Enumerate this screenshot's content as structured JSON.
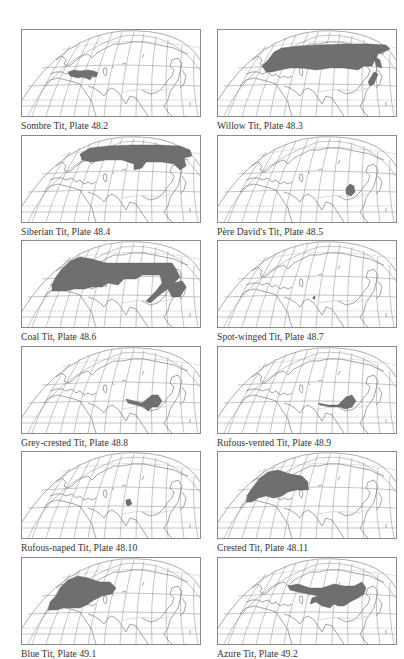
{
  "page": {
    "layout": "2-column grid of range maps, 6 rows",
    "colors": {
      "range_fill": "#6f6f6f",
      "graticule": "#8a8a8a",
      "coastline": "#6a6a6a",
      "frame": "#8a8a8a",
      "caption": "#333333"
    }
  },
  "maps": [
    {
      "caption": "Sombre Tit, Plate 48.2",
      "species": "Sombre Tit",
      "plate": "48.2",
      "range": [
        "M46,42 L52,40 L58,41 L66,40 L72,41 L76,43 L74,47 L70,46 L68,50 L64,48 L60,47 L56,48 L52,47 L48,46 Z"
      ]
    },
    {
      "caption": "Willow Tit, Plate 48.3",
      "species": "Willow Tit",
      "plate": "48.3",
      "range": [
        "M44,36 L50,30 L56,22 L64,18 L80,16 L100,15 L126,14 L150,14 L168,15 L172,19 L166,22 L160,24 L154,36 L146,36 L140,40 L126,38 L112,38 L98,40 L84,38 L72,38 L62,40 L54,42 L48,42 Z",
        "M156,26 L162,30 L164,38 L158,36 Z",
        "M156,42 L160,44 L156,54 L152,56 L150,52 Z"
      ]
    },
    {
      "caption": "Siberian Tit, Plate 48.4",
      "species": "Siberian Tit",
      "plate": "48.4",
      "range": [
        "M58,18 L68,12 L86,10 L110,9 L136,9 L158,10 L168,14 L170,20 L162,22 L164,30 L158,34 L152,28 L140,26 L124,26 L120,32 L112,34 L112,28 L100,24 L84,24 L70,26 L60,24 Z"
      ]
    },
    {
      "caption": "Père David's Tit, Plate 48.5",
      "species": "Père David's Tit",
      "plate": "48.5",
      "range": [
        "M128,52 L132,48 L136,50 L137,56 L133,60 L128,58 Z"
      ]
    },
    {
      "caption": "Coal Tit, Plate 48.6",
      "species": "Coal Tit",
      "plate": "48.6",
      "range": [
        "M30,44 L34,36 L40,28 L48,20 L58,16 L70,18 L84,22 L110,22 L138,22 L150,22 L154,28 L158,36 L152,42 L160,40 L164,46 L158,56 L150,56 L146,48 L140,52 L128,62 L124,60 L134,50 L140,42 L138,34 L120,34 L114,38 L102,38 L96,44 L86,42 L80,46 L70,46 L62,48 L52,48 L44,50 L36,50 L30,50 Z"
      ]
    },
    {
      "caption": "Spot-winged Tit, Plate 48.7",
      "species": "Spot-winged Tit",
      "plate": "48.7",
      "range": [
        "M95,56 L97,55 L97,58 L95,58 Z"
      ]
    },
    {
      "caption": "Grey-crested Tit, Plate 48.8",
      "species": "Grey-crested Tit",
      "plate": "48.8",
      "range": [
        "M104,52 L112,54 L120,56 L130,48 L136,48 L140,54 L136,60 L130,60 L126,64 L122,60 L114,58 L106,56 Z"
      ]
    },
    {
      "caption": "Rufous-vented Tit, Plate 48.9",
      "species": "Rufous-vented Tit",
      "plate": "48.9",
      "range": [
        "M100,56 L110,58 L120,58 L128,50 L134,48 L138,54 L134,60 L128,62 L122,60 L112,60 L102,58 Z"
      ]
    },
    {
      "caption": "Rufous-naped Tit, Plate 48.10",
      "species": "Rufous-naped Tit",
      "plate": "48.10",
      "range": [
        "M104,48 L108,47 L110,52 L106,54 L104,52 Z"
      ]
    },
    {
      "caption": "Crested Tit, Plate 48.11",
      "species": "Crested Tit",
      "plate": "48.11",
      "range": [
        "M28,50 L30,42 L36,34 L42,26 L50,20 L60,18 L72,22 L84,24 L90,30 L90,38 L78,38 L70,40 L64,44 L56,46 L48,44 L40,46 L34,50 Z"
      ]
    },
    {
      "caption": "Blue Tit, Plate 49.1",
      "species": "Blue Tit",
      "plate": "49.1",
      "range": [
        "M26,52 L28,44 L34,38 L38,30 L46,22 L56,18 L66,20 L78,24 L88,24 L94,30 L90,36 L80,38 L72,42 L66,46 L58,50 L50,50 L42,50 L34,52 Z"
      ]
    },
    {
      "caption": "Azure Tit, Plate 49.2",
      "species": "Azure Tit",
      "plate": "49.2",
      "range": [
        "M70,28 L80,26 L92,30 L104,30 L116,26 L126,28 L136,28 L144,24 L148,30 L146,36 L140,40 L132,44 L126,48 L120,48 L116,46 L112,50 L104,48 L98,44 L92,46 L94,40 L100,38 L90,36 L80,34 L72,32 Z"
      ]
    }
  ]
}
